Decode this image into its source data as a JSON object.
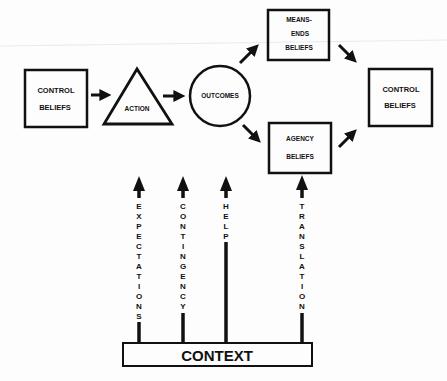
{
  "diagram": {
    "nodes": {
      "control_beliefs_left": {
        "line1": "CONTROL",
        "line2": "BELIEFS"
      },
      "action": {
        "label": "ACTION"
      },
      "outcomes": {
        "label": "OUTCOMES"
      },
      "means_ends_beliefs": {
        "line1": "MEANS-",
        "line2": "ENDS",
        "line3": "BELIEFS"
      },
      "agency_beliefs": {
        "line1": "AGENCY",
        "line2": "BELIEFS"
      },
      "control_beliefs_right": {
        "line1": "CONTROL",
        "line2": "BELIEFS"
      },
      "context": {
        "label": "CONTEXT"
      }
    },
    "context_arrows": [
      {
        "label": "EXPECTATIONS",
        "letters": [
          "E",
          "X",
          "P",
          "E",
          "C",
          "T",
          "A",
          "T",
          "I",
          "O",
          "N",
          "S"
        ]
      },
      {
        "label": "CONTINGENCY",
        "letters": [
          "C",
          "O",
          "N",
          "T",
          "I",
          "N",
          "G",
          "E",
          "N",
          "C",
          "Y"
        ]
      },
      {
        "label": "HELP",
        "letters": [
          "H",
          "E",
          "L",
          "P"
        ]
      },
      {
        "label": "TRANSLATION",
        "letters": [
          "T",
          "R",
          "A",
          "N",
          "S",
          "L",
          "A",
          "T",
          "I",
          "O",
          "N"
        ]
      }
    ],
    "colors": {
      "stroke": "#111111",
      "background": "#fdfdfd"
    }
  }
}
